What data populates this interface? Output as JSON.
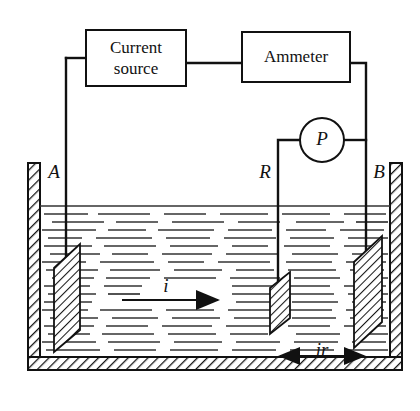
{
  "figure": {
    "kind": "electrolytic-tank-circuit-diagram"
  },
  "components": {
    "current_source": {
      "label_line1": "Current",
      "label_line2": "source"
    },
    "ammeter": {
      "label": "Ammeter"
    },
    "probe": {
      "label": "P"
    }
  },
  "electrodes": [
    {
      "id": "A",
      "label": "A"
    },
    {
      "id": "R",
      "label": "R"
    },
    {
      "id": "B",
      "label": "B"
    }
  ],
  "annotations": {
    "current_arrow_label": "i",
    "distance_label": "ir"
  },
  "colors": {
    "line": "#111111",
    "liquid_line": "#333333",
    "background": "#ffffff",
    "hatch": "#222222"
  }
}
